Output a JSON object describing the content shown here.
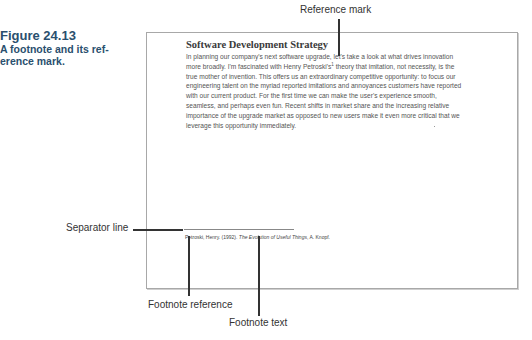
{
  "caption": {
    "figure_number": "Figure 24.13",
    "text": "A footnote and its ref- erence mark."
  },
  "callouts": {
    "reference_mark": "Reference mark",
    "separator_line": "Separator line",
    "footnote_reference": "Footnote reference",
    "footnote_text": "Footnote text"
  },
  "document": {
    "title": "Software Development Strategy",
    "body_lines": [
      "In planning our company's next software upgrade, let's take a look at what drives innovation",
      "more broadly.  I'm fascinated with Henry Petroski's",
      " theory that imitation, not necessity, is the",
      "true mother of invention. This offers us an extraordinary competitive opportunity: to focus our",
      "engineering talent on the myriad reported imitations and annoyances customers have reported",
      "with our current product. For the first time we can make the user's experience smooth,",
      "seamless, and perhaps even fun. Recent shifts in market share and the increasing relative",
      "importance of the upgrade market as opposed to new users make it even more critical that we",
      "leverage this opportunity immediately."
    ],
    "reference_mark_symbol": "1",
    "footnote": {
      "number": "1",
      "plain": "Petroski, Henry. (1992). ",
      "italic": "The Evolution of Useful Things",
      "tail": ", A. Knopf."
    }
  }
}
